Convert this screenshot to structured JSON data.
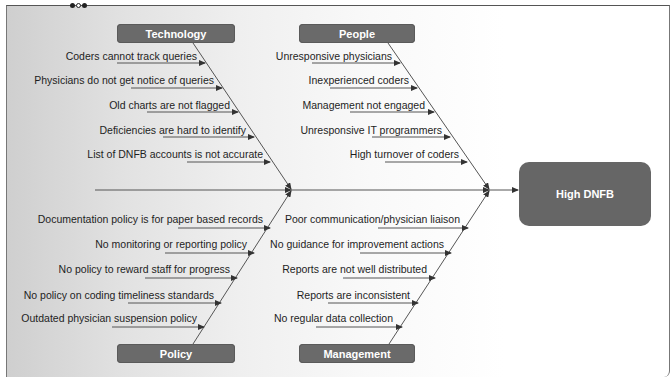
{
  "diagram": {
    "type": "fishbone",
    "effect": "High DNFB",
    "categories": [
      {
        "name": "Technology",
        "causes": [
          "Coders cannot track queries",
          "Physicians do not get notice of queries",
          "Old charts are not flagged",
          "Deficiencies are hard to identify",
          "List of DNFB accounts is not accurate"
        ]
      },
      {
        "name": "People",
        "causes": [
          "Unresponsive physicians",
          "Inexperienced coders",
          "Management not engaged",
          "Unresponsive IT programmers",
          "High turnover of coders"
        ]
      },
      {
        "name": "Policy",
        "causes": [
          "Documentation policy is for paper based records",
          "No monitoring or reporting policy",
          "No policy to reward staff for progress",
          "No policy on coding timeliness standards",
          "Outdated physician suspension policy"
        ]
      },
      {
        "name": "Management",
        "causes": [
          "Poor communication/physician liaison",
          "No guidance for improvement actions",
          "Reports are not well distributed",
          "Reports are inconsistent",
          "No regular data collection"
        ]
      }
    ],
    "colors": {
      "box_fill": "#6a6a6a",
      "line": "#444444",
      "text": "#1e1e1e"
    }
  }
}
